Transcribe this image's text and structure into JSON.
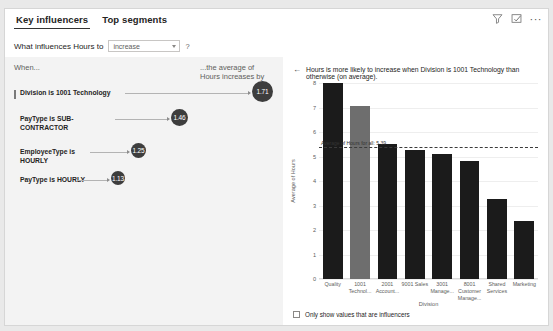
{
  "header": {
    "tabs": [
      {
        "label": "Key influencers",
        "active": true
      },
      {
        "label": "Top segments",
        "active": false
      }
    ],
    "icons": {
      "filter": "filter-icon",
      "focus": "focus-mode-icon",
      "more": "···"
    }
  },
  "question": {
    "label": "What influences Hours to",
    "select_value": "increase",
    "help": "?"
  },
  "left_panel": {
    "when_label": "When...",
    "average_label": "...the average of Hours increases by",
    "influencers": [
      {
        "label": "Division is 1001 Technology",
        "value": "1.71",
        "selected": true
      },
      {
        "label": "PayType is SUB-CONTRACTOR",
        "value": "1.46",
        "selected": false
      },
      {
        "label": "EmployeeType is HOURLY",
        "value": "1.25",
        "selected": false
      },
      {
        "label": "PayType is HOURLY",
        "value": "1.13",
        "selected": false
      }
    ]
  },
  "right_panel": {
    "back_arrow": "←",
    "title": "Hours is more likely to increase when Division is 1001 Technology than otherwise (on average).",
    "checkbox_label": "Only show values that are influencers",
    "checkbox_checked": false
  },
  "chart_data": {
    "type": "bar",
    "title": "Hours is more likely to increase when Division is 1001 Technology than otherwise (on average).",
    "xlabel": "Division",
    "ylabel": "Average of Hours",
    "ylim": [
      0,
      8
    ],
    "yticks": [
      0,
      1,
      2,
      3,
      4,
      5,
      6,
      7,
      8
    ],
    "grid": true,
    "legend": "none",
    "categories": [
      "Quality",
      "1001 Technol...",
      "2001 Account...",
      "9001 Sales",
      "3001 Manage...",
      "8001 Customer Manage...",
      "Shared Services",
      "Marketing"
    ],
    "values": [
      8.0,
      7.05,
      5.5,
      5.25,
      5.1,
      4.8,
      3.25,
      2.35
    ],
    "highlight_index": 1,
    "bar_color": "#1b1b1b",
    "highlight_color": "#6e6e6e",
    "annotation": {
      "text": "Average of Hours for all: 5.39",
      "value": 5.39,
      "style": "dashed-line"
    }
  }
}
